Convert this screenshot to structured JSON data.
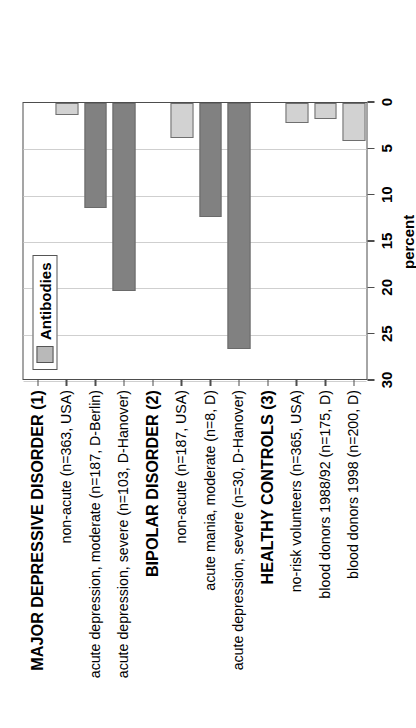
{
  "chart_data": {
    "type": "bar",
    "title": "",
    "orientation": "rotated-90",
    "xlabel": "",
    "ylabel": "percent",
    "ylim": [
      0,
      30
    ],
    "ticks": [
      "0",
      "5",
      "10",
      "15",
      "20",
      "25",
      "30"
    ],
    "grid": true,
    "legend": {
      "position": "top-left",
      "entries": [
        "Antibodies"
      ]
    },
    "categories": [
      "MAJOR DEPRESSIVE DISORDER (1)",
      "non-acute (n=363, USA)",
      "acute depression, moderate (n=187, D-Berlin)",
      "acute depression, severe (n=103, D-Hanover)",
      "BIPOLAR DISORDER (2)",
      "non-acute (n=187, USA)",
      "acute mania, moderate (n=8, D)",
      "acute depression, severe (n=30, D-Hanover)",
      "HEALTHY CONTROLS (3)",
      "no-risk volunteers (n=365, USA)",
      "blood donors 1988/92 (n=175, D)",
      "blood donors 1998 (n=200, D)"
    ],
    "is_header": [
      true,
      false,
      false,
      false,
      true,
      false,
      false,
      false,
      true,
      false,
      false,
      false
    ],
    "values": [
      null,
      1.3,
      11.3,
      20.3,
      null,
      3.8,
      12.3,
      26.5,
      null,
      2.2,
      1.7,
      4.1
    ],
    "bar_styles": [
      null,
      "light",
      "dark",
      "dark",
      null,
      "light",
      "dark",
      "dark",
      null,
      "light",
      "light",
      "light"
    ],
    "series": [
      {
        "name": "Antibodies",
        "values": [
          null,
          1.3,
          11.3,
          20.3,
          null,
          3.8,
          12.3,
          26.5,
          null,
          2.2,
          1.7,
          4.1
        ]
      }
    ],
    "colors": {
      "dark_bar": "#818181",
      "light_bar": "#d2d2d2",
      "bar_outline": "#6a6a6a",
      "gridline": "#cfcfcf",
      "axis": "#4d4d4d",
      "background": "#ffffff",
      "text": "#000000",
      "legend_swatch": "#b9b9b9"
    }
  },
  "axis": {
    "title": "percent"
  },
  "legend": {
    "label": "Antibodies"
  }
}
